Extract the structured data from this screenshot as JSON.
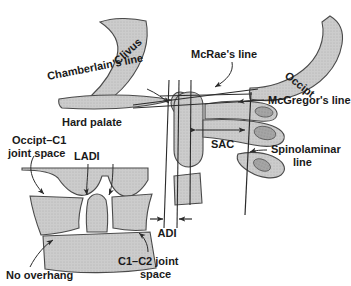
{
  "figure": {
    "width": 351,
    "height": 286,
    "background_color": "#ffffff"
  },
  "colors": {
    "bone_fill": "#c9c9c9",
    "bone_fill_light": "#d5d5d5",
    "bone_stroke": "#4a4a4a",
    "core_fill": "#9a9a9a",
    "line_color": "#2b2b2b",
    "text_color": "#1a1a1a"
  },
  "main_view": {
    "name": "lateral-craniocervical-view",
    "structures": [
      {
        "id": "clivus",
        "label": "Clivus",
        "rotation_deg": -42,
        "label_x": 118,
        "label_y": 65
      },
      {
        "id": "occiput",
        "label": "Occipt",
        "rotation_deg": 38,
        "label_x": 284,
        "label_y": 77
      },
      {
        "id": "hard-palate",
        "label": "Hard palate",
        "label_x": 62,
        "label_y": 122
      },
      {
        "id": "sac",
        "label": "SAC",
        "label_x": 211,
        "label_y": 144
      }
    ],
    "reference_lines": [
      {
        "id": "chamberlains-line",
        "label": "Chamberlain's line",
        "label_x": 48,
        "label_y": 80,
        "rotation_deg": -11
      },
      {
        "id": "mcraes-line",
        "label": "McRae's line",
        "label_x": 191,
        "label_y": 58
      },
      {
        "id": "mcgregors-line",
        "label": "McGregor's line",
        "label_x": 268,
        "label_y": 104
      },
      {
        "id": "spinolaminar-line",
        "label_line1": "Spinolaminar",
        "label_line2": "line",
        "label_x": 271,
        "label_y": 152
      }
    ],
    "measurements": [
      {
        "id": "adi",
        "label": "ADI",
        "label_x": 181,
        "label_y": 233,
        "arrow_style": "double-inward"
      },
      {
        "id": "sac-width",
        "label": "SAC",
        "arrow_style": "double-outward"
      }
    ]
  },
  "inset_view": {
    "name": "ap-craniocervical-inset",
    "labels": [
      {
        "id": "occipt-c1-joint-space",
        "line1": "Occipt–C1",
        "line2": "joint space",
        "x": 12,
        "y": 140
      },
      {
        "id": "ladi",
        "text": "LADI",
        "x": 75,
        "y": 160
      },
      {
        "id": "no-overhang",
        "text": "No overhang",
        "x": 8,
        "y": 277
      },
      {
        "id": "c1-c2-joint-space",
        "line1": "C1–C2 joint",
        "line2": "space",
        "x": 122,
        "y": 262
      }
    ]
  }
}
